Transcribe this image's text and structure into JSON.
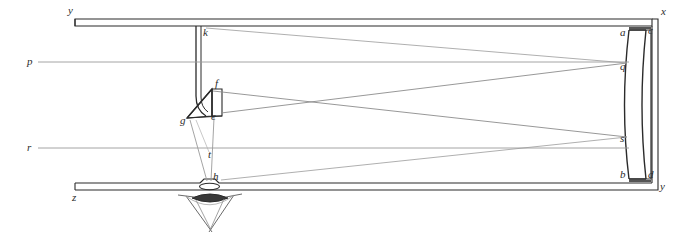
{
  "figure": {
    "type": "line-diagram",
    "background_color": "#ffffff",
    "ink_color": "#2b2b2b",
    "ray_color": "#8c8c8c",
    "width": 697,
    "height": 237
  },
  "labels": {
    "y_top_left": "y",
    "z_bottom_left": "z",
    "x_top_right": "x",
    "y_bottom_right": "y",
    "p_ray": "p",
    "r_ray": "r",
    "k_strut": "k",
    "f_prism_top": "f",
    "g_prism_left": "g",
    "e_prism_right": "e",
    "t_focus": "t",
    "h_aperture": "h",
    "a_mirror_top_front": "a",
    "b_mirror_bottom_front": "b",
    "c_mirror_top_back": "c",
    "d_mirror_bottom_back": "d",
    "q_mirror_upper": "q",
    "s_mirror_lower": "s"
  },
  "label_positions": {
    "y_top_left": {
      "x": 68,
      "y": 14
    },
    "z_bottom_left": {
      "x": 72,
      "y": 201
    },
    "x_top_right": {
      "x": 661,
      "y": 15
    },
    "y_bottom_right": {
      "x": 660,
      "y": 190
    },
    "p_ray": {
      "x": 27,
      "y": 65
    },
    "r_ray": {
      "x": 27,
      "y": 151
    },
    "k_strut": {
      "x": 203,
      "y": 36
    },
    "f_prism_top": {
      "x": 215,
      "y": 87
    },
    "g_prism_left": {
      "x": 180,
      "y": 124
    },
    "e_prism_right": {
      "x": 211,
      "y": 120
    },
    "t_focus": {
      "x": 208,
      "y": 158
    },
    "h_aperture": {
      "x": 213,
      "y": 180
    },
    "a_mirror_top_front": {
      "x": 622,
      "y": 36
    },
    "b_mirror_bottom_front": {
      "x": 622,
      "y": 177
    },
    "c_mirror_top_back": {
      "x": 648,
      "y": 34
    },
    "d_mirror_bottom_back": {
      "x": 648,
      "y": 177
    },
    "q_mirror_upper": {
      "x": 622,
      "y": 70
    },
    "s_mirror_lower": {
      "x": 622,
      "y": 141
    }
  },
  "components": {
    "tube": {
      "name": "telescope-tube",
      "top_wall_y": [
        19,
        26
      ],
      "bottom_wall_y": [
        183,
        190
      ],
      "left_end_x": 75,
      "right_end_x": 655
    },
    "primary_mirror": {
      "name": "curved-primary-mirror",
      "front_surface": "a-b",
      "back_surface": "c-d",
      "curvature": "concave-toward-left"
    },
    "diagonal_prism": {
      "name": "diagonal-flat-prism",
      "vertices": "f-g-e",
      "function": "folds beam to eyepiece"
    },
    "eyepiece": {
      "name": "eyepiece-lens",
      "aperture": "h",
      "focus_point": "t"
    }
  },
  "rays": {
    "incoming": [
      "p",
      "r"
    ],
    "reflected_from": [
      "q",
      "s"
    ],
    "converge_at": "t",
    "exit_through": "h"
  }
}
